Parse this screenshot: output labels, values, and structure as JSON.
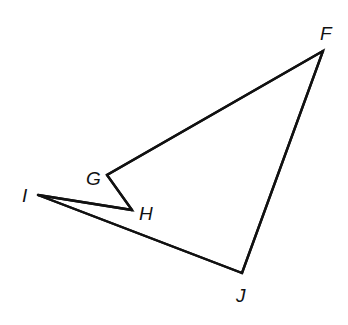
{
  "diagram": {
    "type": "polygon",
    "vertices": [
      {
        "id": "F",
        "label": "F"
      },
      {
        "id": "G",
        "label": "G"
      },
      {
        "id": "H",
        "label": "H"
      },
      {
        "id": "I",
        "label": "I"
      },
      {
        "id": "J",
        "label": "J"
      }
    ],
    "edges": [
      [
        "F",
        "G"
      ],
      [
        "G",
        "H"
      ],
      [
        "H",
        "I"
      ],
      [
        "I",
        "J"
      ],
      [
        "J",
        "F"
      ]
    ],
    "stroke_color": "#111111",
    "background": "#ffffff"
  }
}
